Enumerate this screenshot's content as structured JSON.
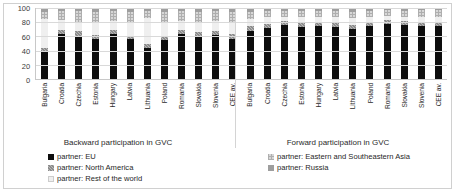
{
  "chart_data": {
    "type": "bar",
    "subtype": "stacked-100-percent",
    "title": "",
    "xlabel": "",
    "ylabel": "",
    "ylim": [
      0,
      100
    ],
    "yticks": [
      0,
      20,
      40,
      60,
      80,
      100
    ],
    "grid": true,
    "legend_position": "bottom",
    "panels": [
      {
        "title": "Backward participation in GVC",
        "categories": [
          "Bulgaria",
          "Croatia",
          "Czechia",
          "Estonia",
          "Hungary",
          "Latvia",
          "Lithuania",
          "Poland",
          "Romania",
          "Slovakia",
          "Slovenia",
          "CEE av."
        ],
        "series": [
          {
            "name": "partner: EU",
            "values": [
              39,
              63,
              61,
              56,
              64,
              56,
              44,
              55,
              64,
              60,
              62,
              57
            ]
          },
          {
            "name": "partner: North America",
            "values": [
              5,
              6,
              7,
              6,
              5,
              5,
              6,
              6,
              5,
              6,
              5,
              6
            ]
          },
          {
            "name": "partner: Rest of the world",
            "values": [
              40,
              14,
              13,
              18,
              13,
              19,
              36,
              20,
              13,
              15,
              15,
              18
            ]
          },
          {
            "name": "partner: Eastern and Southeastern Asia",
            "values": [
              11,
              13,
              15,
              15,
              14,
              15,
              10,
              14,
              14,
              14,
              14,
              14
            ]
          },
          {
            "name": "partner: Russia",
            "values": [
              5,
              4,
              4,
              5,
              4,
              5,
              4,
              5,
              4,
              5,
              4,
              5
            ]
          }
        ]
      },
      {
        "title": "Forward participation in GVC",
        "categories": [
          "Bulgaria",
          "Croatia",
          "Czechia",
          "Estonia",
          "Hungary",
          "Latvia",
          "Lithuania",
          "Poland",
          "Romania",
          "Slovakia",
          "Slovenia",
          "CEE av."
        ],
        "series": [
          {
            "name": "partner: EU",
            "values": [
              68,
              72,
              76,
              73,
              75,
              73,
              70,
              74,
              78,
              76,
              75,
              74
            ]
          },
          {
            "name": "partner: North America",
            "values": [
              6,
              6,
              6,
              6,
              6,
              6,
              6,
              6,
              5,
              6,
              6,
              6
            ]
          },
          {
            "name": "partner: Rest of the world",
            "values": [
              11,
              9,
              6,
              8,
              7,
              8,
              10,
              7,
              6,
              6,
              7,
              8
            ]
          },
          {
            "name": "partner: Eastern and Southeastern Asia",
            "values": [
              10,
              9,
              8,
              9,
              8,
              9,
              9,
              9,
              8,
              8,
              9,
              9
            ]
          },
          {
            "name": "partner: Russia",
            "values": [
              5,
              4,
              4,
              4,
              4,
              4,
              5,
              4,
              3,
              4,
              3,
              3
            ]
          }
        ]
      }
    ],
    "legend": [
      {
        "label": "partner: EU",
        "key": "eu",
        "color": "#0d0d0d"
      },
      {
        "label": "partner: North America",
        "key": "na",
        "color": "#b9b9b9"
      },
      {
        "label": "partner: Rest of the world",
        "key": "row",
        "color": "#efefef"
      },
      {
        "label": "partner: Eastern and Southeastern Asia",
        "key": "asia",
        "color": "#d7d7d7"
      },
      {
        "label": "partner: Russia",
        "key": "rus",
        "color": "#9e9e9e"
      }
    ]
  }
}
